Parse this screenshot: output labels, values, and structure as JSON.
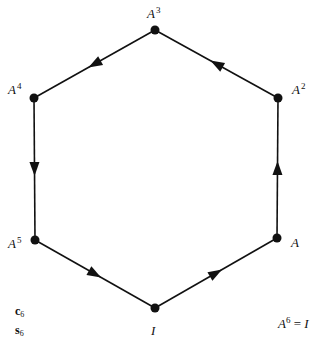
{
  "diagram": {
    "type": "cycle-graph",
    "nodes": [
      {
        "id": "I",
        "base": "I",
        "exp": "",
        "x": 155,
        "y": 308
      },
      {
        "id": "A",
        "base": "A",
        "exp": "",
        "x": 277,
        "y": 238
      },
      {
        "id": "A2",
        "base": "A",
        "exp": "2",
        "x": 278,
        "y": 98
      },
      {
        "id": "A3",
        "base": "A",
        "exp": "3",
        "x": 155,
        "y": 30
      },
      {
        "id": "A4",
        "base": "A",
        "exp": "4",
        "x": 34,
        "y": 98
      },
      {
        "id": "A5",
        "base": "A",
        "exp": "5",
        "x": 35,
        "y": 240
      }
    ],
    "edges": [
      {
        "from": "I",
        "to": "A"
      },
      {
        "from": "A",
        "to": "A2"
      },
      {
        "from": "A2",
        "to": "A3"
      },
      {
        "from": "A3",
        "to": "A4"
      },
      {
        "from": "A4",
        "to": "A5"
      },
      {
        "from": "A5",
        "to": "I"
      }
    ],
    "group_names": [
      {
        "base": "c",
        "sub": "6"
      },
      {
        "base": "s",
        "sub": "6"
      }
    ],
    "relation": {
      "lhs_base": "A",
      "lhs_exp": "6",
      "op": "=",
      "rhs": "I"
    },
    "colors": {
      "line": "#111111",
      "node": "#111111",
      "background": "#ffffff"
    }
  }
}
